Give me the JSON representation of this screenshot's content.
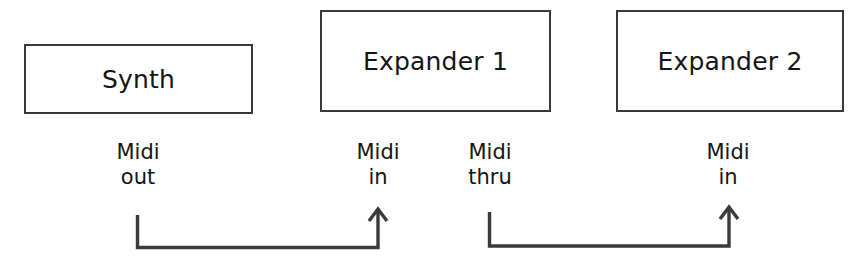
{
  "diagram": {
    "background_color": "#ffffff",
    "line_color": "#3a3a3c",
    "text_color": "#141414",
    "devices": [
      {
        "id": "synth",
        "label": "Synth"
      },
      {
        "id": "expander-1",
        "label": "Expander 1"
      },
      {
        "id": "expander-2",
        "label": "Expander 2"
      }
    ],
    "ports": [
      {
        "id": "midi-out",
        "line1": "Midi",
        "line2": "out"
      },
      {
        "id": "midi-in-1",
        "line1": "Midi",
        "line2": "in"
      },
      {
        "id": "midi-thru",
        "line1": "Midi",
        "line2": "thru"
      },
      {
        "id": "midi-in-2",
        "line1": "Midi",
        "line2": "in"
      }
    ],
    "connections": [
      {
        "id": "cable-1",
        "from": "midi-out",
        "to": "midi-in-1",
        "arrow": "up"
      },
      {
        "id": "cable-2",
        "from": "midi-thru",
        "to": "midi-in-2",
        "arrow": "up"
      }
    ]
  }
}
